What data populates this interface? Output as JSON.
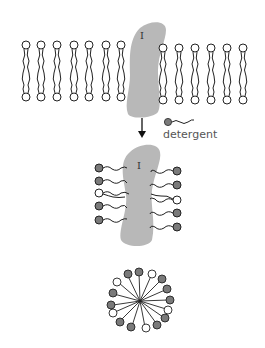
{
  "figure": {
    "protein_label": "I",
    "protein_label_2": "I",
    "legend": {
      "label": "detergent",
      "icon": "detergent-molecule-icon"
    },
    "colors": {
      "protein": "#b8b8b8",
      "detergent_head": "#7a7a7a",
      "lipid_head": "#ffffff",
      "stroke": "#222222"
    },
    "stages": [
      "lipid bilayer with membrane protein",
      "protein solubilized in detergent",
      "detergent micelle"
    ]
  }
}
